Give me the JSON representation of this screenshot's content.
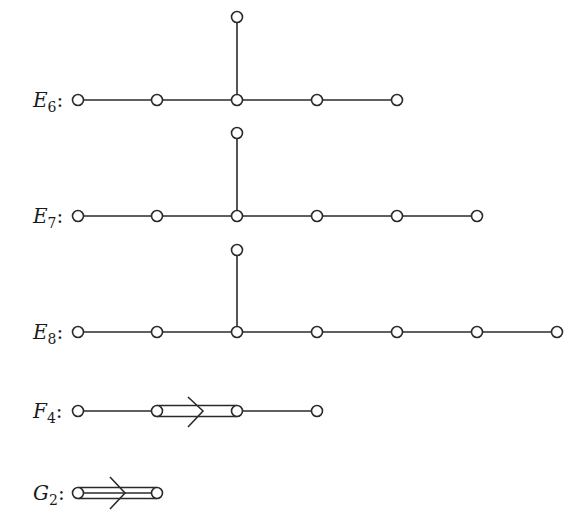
{
  "diagrams": [
    {
      "id": "E6",
      "letter": "E",
      "index": "6",
      "colon": ":",
      "y": 100,
      "nodes_x": [
        78,
        157,
        237,
        317,
        397
      ],
      "branch": {
        "x": 237,
        "y": 17
      },
      "bond": null
    },
    {
      "id": "E7",
      "letter": "E",
      "index": "7",
      "colon": ":",
      "y": 216,
      "nodes_x": [
        78,
        157,
        237,
        317,
        397,
        477
      ],
      "branch": {
        "x": 237,
        "y": 133
      },
      "bond": null
    },
    {
      "id": "E8",
      "letter": "E",
      "index": "8",
      "colon": ":",
      "y": 332,
      "nodes_x": [
        78,
        157,
        237,
        317,
        397,
        477,
        557
      ],
      "branch": {
        "x": 237,
        "y": 250
      },
      "bond": null
    },
    {
      "id": "F4",
      "letter": "F",
      "index": "4",
      "colon": ":",
      "y": 411,
      "nodes_x": [
        78,
        157,
        237,
        317
      ],
      "branch": null,
      "bond": {
        "from": 157,
        "to": 237,
        "multiplicity": 2,
        "arrow": "right"
      }
    },
    {
      "id": "G2",
      "letter": "G",
      "index": "2",
      "colon": ":",
      "y": 493,
      "nodes_x": [
        78,
        157
      ],
      "branch": null,
      "bond": {
        "from": 78,
        "to": 157,
        "multiplicity": 3,
        "arrow": "right"
      }
    }
  ],
  "colors": {
    "stroke": "#2a2a2a",
    "node_fill": "#ffffff",
    "background": "#ffffff"
  }
}
